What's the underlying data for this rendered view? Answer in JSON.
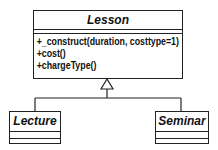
{
  "diagram": {
    "type": "uml-class-diagram",
    "parent": {
      "name": "Lesson",
      "attributes": [],
      "operations": [
        "+_construct(duration, costtype=1)",
        "+cost()",
        "+chargeType()"
      ]
    },
    "children": [
      {
        "name": "Lecture",
        "attributes": [],
        "operations": []
      },
      {
        "name": "Seminar",
        "attributes": [],
        "operations": []
      }
    ],
    "relationship": "generalization"
  }
}
